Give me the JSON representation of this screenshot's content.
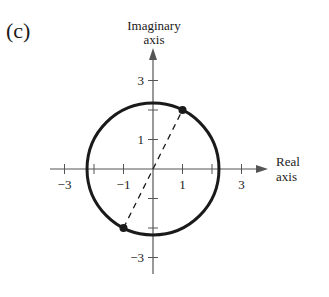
{
  "panel_label": "(c)",
  "axes": {
    "x_label_line1": "Real",
    "x_label_line2": "axis",
    "y_label_line1": "Imaginary",
    "y_label_line2": "axis",
    "x_ticks": [
      -3,
      -2,
      -1,
      1,
      2,
      3
    ],
    "x_tick_labels": [
      {
        "value": -3,
        "text": "−3"
      },
      {
        "value": -1,
        "text": "−1"
      },
      {
        "value": 1,
        "text": "1"
      },
      {
        "value": 3,
        "text": "3"
      }
    ],
    "y_ticks": [
      -3,
      -2,
      -1,
      1,
      2,
      3
    ],
    "y_tick_labels": [
      {
        "value": 3,
        "text": "3"
      },
      {
        "value": 1,
        "text": "1"
      },
      {
        "value": -3,
        "text": "−3"
      }
    ],
    "range": [
      -3.2,
      3.2
    ]
  },
  "circle": {
    "center": [
      0,
      0
    ],
    "radius": 2.236
  },
  "points": [
    {
      "x": 1,
      "y": 2
    },
    {
      "x": -1,
      "y": -2
    }
  ],
  "diameter": {
    "from": [
      -1,
      -2
    ],
    "to": [
      1,
      2
    ],
    "style": "dashed"
  },
  "colors": {
    "ink": "#1a1a1a",
    "axis": "#555555"
  }
}
